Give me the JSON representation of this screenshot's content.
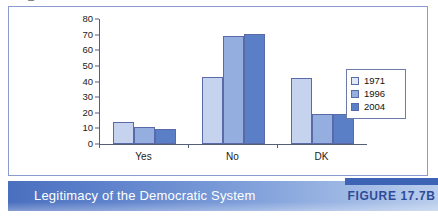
{
  "figure": {
    "caption": "Legitimacy of the Democratic System",
    "tag": "FIGURE 17.7B"
  },
  "legend": {
    "entries": [
      "1971",
      "1996",
      "2004"
    ]
  },
  "colors": {
    "series_1971": "#c5d3ee",
    "series_1996": "#93aedf",
    "series_2004": "#5b7fc7",
    "bar_outline": "#5a6aa8",
    "axis": "#555f7a",
    "panel_border": "#8b9ad0",
    "caption_band_start": "#4a6fbe",
    "caption_band_end": "#b9cdec",
    "figure_tag_text": "#2d4c98",
    "figure_tag_bar": "#3c63b4"
  },
  "chart_data": {
    "type": "bar",
    "title": "Legitimacy of the Democratic System",
    "xlabel": "",
    "ylabel": "Percentage",
    "categories": [
      "Yes",
      "No",
      "DK"
    ],
    "series": [
      {
        "name": "1971",
        "values": [
          14,
          43,
          42
        ]
      },
      {
        "name": "1996",
        "values": [
          11,
          69,
          19.5
        ]
      },
      {
        "name": "2004",
        "values": [
          9.5,
          70.5,
          19.5
        ]
      }
    ],
    "ylim": [
      0,
      80
    ],
    "yticks": [
      0,
      10,
      20,
      30,
      40,
      50,
      60,
      70,
      80
    ],
    "ytick_labels": [
      "0",
      "10",
      "20",
      "30",
      "40",
      "50",
      "60",
      "70",
      "80"
    ],
    "grid": false,
    "legend_position": "right"
  }
}
